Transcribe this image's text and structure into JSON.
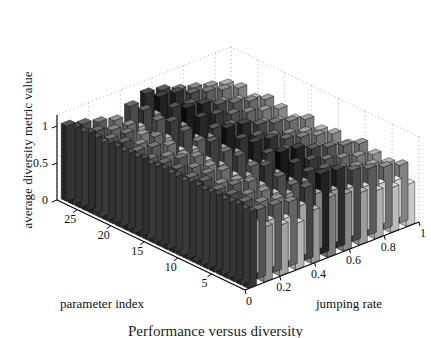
{
  "figure": {
    "caption": "Performance versus diversity",
    "background": "#ffffff",
    "ink": "#111111"
  },
  "axes": {
    "z_label": "average diversity metric value",
    "x_label": "parameter index",
    "y_label": "jumping rate"
  },
  "chart_data": {
    "type": "bar",
    "subtype": "bar3",
    "title": "",
    "xlabel": "parameter index",
    "ylabel": "jumping rate",
    "zlabel": "average diversity metric value",
    "grid": true,
    "legend": null,
    "projection": "3d-isometric",
    "x_ticks": [
      25,
      20,
      15,
      10,
      5
    ],
    "x_range": [
      1,
      28
    ],
    "y_ticks": [
      0,
      0.2,
      0.4,
      0.6,
      0.8,
      1
    ],
    "y_tick_labels": [
      "0",
      "0.2",
      "0.4",
      "0.6",
      "0.8",
      "1"
    ],
    "y_range": [
      0,
      1
    ],
    "z_ticks": [
      0,
      0.5,
      1
    ],
    "z_tick_labels": [
      "0",
      "0.5",
      "1"
    ],
    "zlim": [
      0,
      1.15
    ],
    "n_param_index": 28,
    "n_jumping_rate": 11,
    "jumping_rate_values": [
      0,
      0.1,
      0.2,
      0.3,
      0.4,
      0.5,
      0.6,
      0.7,
      0.8,
      0.9,
      1.0
    ],
    "colormap": "gray-by-height",
    "note": "Each row is one jumping-rate level; each column is one parameter index. Values are the average diversity metric.",
    "series": [
      {
        "name": "jumping rate 0",
        "jumping_rate": 0,
        "values": [
          1.02,
          1.03,
          1.01,
          1.04,
          1.02,
          1.0,
          1.03,
          1.02,
          1.01,
          1.03,
          1.02,
          1.04,
          1.01,
          1.02,
          1.03,
          1.01,
          1.02,
          1.0,
          1.03,
          1.02,
          1.01,
          1.02,
          1.03,
          1.01,
          1.02,
          1.03,
          1.01,
          1.02
        ]
      },
      {
        "name": "jumping rate 0.1",
        "jumping_rate": 0.1,
        "values": [
          0.96,
          0.72,
          0.95,
          0.7,
          0.93,
          0.74,
          0.97,
          0.71,
          0.94,
          0.76,
          0.92,
          0.7,
          0.95,
          0.73,
          0.96,
          0.69,
          0.93,
          0.75,
          0.97,
          0.72,
          0.94,
          0.7,
          0.96,
          0.73,
          0.95,
          0.71,
          0.93,
          0.74
        ]
      },
      {
        "name": "jumping rate 0.2",
        "jumping_rate": 0.2,
        "values": [
          0.9,
          0.66,
          0.88,
          0.64,
          0.92,
          0.68,
          0.86,
          0.62,
          0.91,
          0.7,
          0.87,
          0.65,
          0.93,
          0.67,
          0.89,
          0.63,
          0.9,
          0.69,
          0.85,
          0.66,
          0.92,
          0.64,
          0.88,
          0.71,
          0.86,
          0.65,
          0.91,
          0.68
        ]
      },
      {
        "name": "jumping rate 0.3",
        "jumping_rate": 0.3,
        "values": [
          0.84,
          0.6,
          0.86,
          0.58,
          0.82,
          0.62,
          0.88,
          0.56,
          0.85,
          0.64,
          0.8,
          0.59,
          0.87,
          0.61,
          0.83,
          0.57,
          0.86,
          0.63,
          0.81,
          0.6,
          0.88,
          0.58,
          0.84,
          0.65,
          0.82,
          0.59,
          0.87,
          0.62
        ]
      },
      {
        "name": "jumping rate 0.4",
        "jumping_rate": 0.4,
        "values": [
          0.95,
          0.7,
          0.98,
          0.66,
          0.93,
          0.72,
          1.0,
          0.64,
          0.96,
          0.74,
          0.91,
          0.68,
          0.99,
          0.7,
          0.94,
          0.65,
          0.97,
          0.73,
          0.92,
          0.69,
          1.01,
          0.67,
          0.95,
          0.75,
          0.93,
          0.68,
          0.98,
          0.71
        ]
      },
      {
        "name": "jumping rate 0.5",
        "jumping_rate": 0.5,
        "values": [
          1.04,
          0.78,
          1.08,
          0.74,
          1.02,
          0.8,
          1.1,
          0.72,
          1.06,
          0.82,
          1.0,
          0.76,
          1.09,
          0.79,
          1.03,
          0.73,
          1.07,
          0.81,
          1.01,
          0.77,
          1.11,
          0.75,
          1.05,
          0.83,
          1.02,
          0.76,
          1.08,
          0.8
        ]
      },
      {
        "name": "jumping rate 0.6",
        "jumping_rate": 0.6,
        "values": [
          1.0,
          0.74,
          1.05,
          0.7,
          0.98,
          0.77,
          1.07,
          0.68,
          1.02,
          0.79,
          0.96,
          0.72,
          1.06,
          0.75,
          0.99,
          0.69,
          1.04,
          0.78,
          0.97,
          0.73,
          1.08,
          0.71,
          1.01,
          0.8,
          0.98,
          0.72,
          1.05,
          0.76
        ]
      },
      {
        "name": "jumping rate 0.7",
        "jumping_rate": 0.7,
        "values": [
          0.92,
          0.68,
          0.96,
          0.64,
          0.9,
          0.7,
          0.98,
          0.62,
          0.94,
          0.72,
          0.88,
          0.66,
          0.97,
          0.69,
          0.91,
          0.63,
          0.95,
          0.71,
          0.89,
          0.67,
          0.99,
          0.65,
          0.93,
          0.73,
          0.9,
          0.66,
          0.96,
          0.7
        ]
      },
      {
        "name": "jumping rate 0.8",
        "jumping_rate": 0.8,
        "values": [
          0.86,
          0.62,
          0.9,
          0.58,
          0.84,
          0.64,
          0.92,
          0.56,
          0.88,
          0.66,
          0.82,
          0.6,
          0.91,
          0.63,
          0.85,
          0.57,
          0.89,
          0.65,
          0.83,
          0.61,
          0.93,
          0.59,
          0.87,
          0.67,
          0.84,
          0.6,
          0.9,
          0.64
        ]
      },
      {
        "name": "jumping rate 0.9",
        "jumping_rate": 0.9,
        "values": [
          0.8,
          0.58,
          0.84,
          0.54,
          0.78,
          0.6,
          0.86,
          0.52,
          0.82,
          0.62,
          0.76,
          0.56,
          0.85,
          0.59,
          0.79,
          0.53,
          0.83,
          0.61,
          0.77,
          0.57,
          0.87,
          0.55,
          0.81,
          0.63,
          0.78,
          0.56,
          0.84,
          0.6
        ]
      },
      {
        "name": "jumping rate 1",
        "jumping_rate": 1.0,
        "values": [
          0.74,
          0.54,
          0.78,
          0.5,
          0.72,
          0.56,
          0.8,
          0.48,
          0.76,
          0.58,
          0.7,
          0.52,
          0.79,
          0.55,
          0.73,
          0.49,
          0.77,
          0.57,
          0.71,
          0.53,
          0.81,
          0.51,
          0.75,
          0.59,
          0.72,
          0.52,
          0.78,
          0.56
        ]
      }
    ]
  }
}
